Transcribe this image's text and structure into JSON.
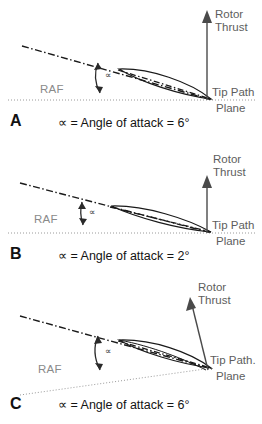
{
  "figure": {
    "symbol": "∝",
    "degree": "°"
  },
  "panels": [
    {
      "letter": "A",
      "caption": "∝ = Angle of attack = 6°",
      "raf_label": "RAF",
      "alpha_label": "∝",
      "thrust_label_line1": "Rotor",
      "thrust_label_line2": "Thrust",
      "tpp_label_line1": "Tip Path",
      "tpp_label_line2": "Plane",
      "angle_of_attack": "6°"
    },
    {
      "letter": "B",
      "caption": "∝ = Angle of attack = 2°",
      "raf_label": "RAF",
      "alpha_label": "∝",
      "thrust_label_line1": "Rotor",
      "thrust_label_line2": "Thrust",
      "tpp_label_line1": "Tip Path",
      "tpp_label_line2": "Plane",
      "angle_of_attack": "2°"
    },
    {
      "letter": "C",
      "caption": "∝ = Angle of attack = 6°",
      "raf_label": "RAF",
      "alpha_label": "∝",
      "thrust_label_line1": "Rotor",
      "thrust_label_line2": "Thrust",
      "tpp_label_line1": "Tip Path.",
      "tpp_label_line2": "Plane",
      "angle_of_attack": "6°"
    }
  ],
  "colors": {
    "ink": "#1a1a1a",
    "label_gray": "#5d5d5d",
    "raf_gray": "#8a8a8a",
    "background": "#ffffff"
  }
}
